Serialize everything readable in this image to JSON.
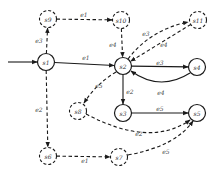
{
  "diagram": {
    "type": "state-transition-graph",
    "nodes": [
      {
        "id": "s1",
        "label": "s1",
        "style": "solid"
      },
      {
        "id": "s2",
        "label": "s2",
        "style": "solid"
      },
      {
        "id": "s3",
        "label": "s3",
        "style": "solid"
      },
      {
        "id": "s4",
        "label": "s4",
        "style": "solid"
      },
      {
        "id": "s5",
        "label": "s5",
        "style": "solid"
      },
      {
        "id": "s6",
        "label": "s6",
        "style": "dashed"
      },
      {
        "id": "s7",
        "label": "s7",
        "style": "dashed"
      },
      {
        "id": "s8",
        "label": "s8",
        "style": "dashed"
      },
      {
        "id": "s9",
        "label": "s9",
        "style": "dashed"
      },
      {
        "id": "s10",
        "label": "s10",
        "style": "dashed"
      },
      {
        "id": "s11",
        "label": "s11",
        "style": "dashed"
      }
    ],
    "initial_state": "s1",
    "edges": [
      {
        "from": "s1",
        "to": "s2",
        "label": "e1",
        "style": "solid"
      },
      {
        "from": "s1",
        "to": "s9",
        "label": "e3",
        "style": "dashed"
      },
      {
        "from": "s1",
        "to": "s6",
        "label": "e2",
        "style": "dashed"
      },
      {
        "from": "s9",
        "to": "s10",
        "label": "e1",
        "style": "dashed"
      },
      {
        "from": "s10",
        "to": "s2",
        "label": "e4",
        "style": "dashed"
      },
      {
        "from": "s2",
        "to": "s11",
        "label": "e3",
        "style": "dashed"
      },
      {
        "from": "s11",
        "to": "s2",
        "label": "e4",
        "style": "dashed"
      },
      {
        "from": "s2",
        "to": "s8",
        "label": "e5",
        "style": "dashed"
      },
      {
        "from": "s2",
        "to": "s4",
        "label": "e3",
        "style": "solid"
      },
      {
        "from": "s4",
        "to": "s2",
        "label": "e4",
        "style": "solid"
      },
      {
        "from": "s2",
        "to": "s3",
        "label": "e2",
        "style": "solid"
      },
      {
        "from": "s3",
        "to": "s5",
        "label": "e5",
        "style": "solid"
      },
      {
        "from": "s8",
        "to": "s5",
        "label": "e2",
        "style": "dashed"
      },
      {
        "from": "s6",
        "to": "s7",
        "label": "e1",
        "style": "dashed"
      },
      {
        "from": "s7",
        "to": "s5",
        "label": "e5",
        "style": "dashed"
      }
    ]
  }
}
